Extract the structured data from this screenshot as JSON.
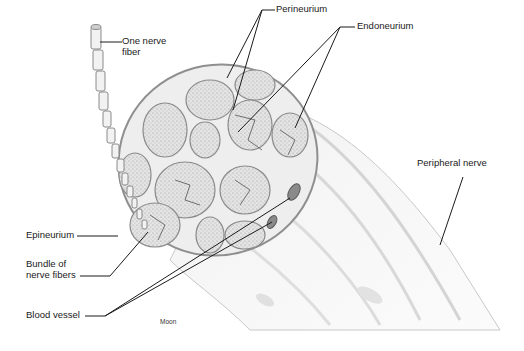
{
  "diagram": {
    "labels": {
      "one_nerve_fiber_line1": "One nerve",
      "one_nerve_fiber_line2": "fiber",
      "perineurium": "Perineurium",
      "endoneurium": "Endoneurium",
      "peripheral_nerve": "Peripheral nerve",
      "epineurium": "Epineurium",
      "bundle_line1": "Bundle of",
      "bundle_line2": "nerve fibers",
      "blood_vessel": "Blood vessel"
    },
    "credit": "Moon",
    "colors": {
      "background": "#ffffff",
      "line": "#1a1a1a",
      "tissue_fill": "#ececec",
      "tissue_stroke": "#9a9a9a",
      "fascicle_fill": "#dedede",
      "vessel_fill": "#8a8a8a"
    }
  }
}
